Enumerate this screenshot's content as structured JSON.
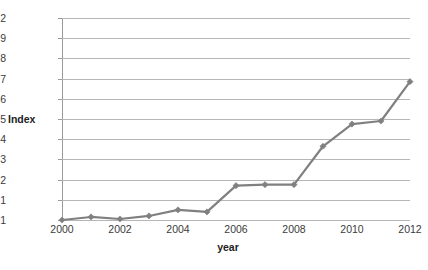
{
  "chart_data": {
    "type": "line",
    "title": "",
    "xlabel": "year",
    "ylabel": "Index",
    "x": [
      2000,
      2001,
      2002,
      2003,
      2004,
      2005,
      2006,
      2007,
      2008,
      2009,
      2010,
      2011,
      2012
    ],
    "xtick_labels": [
      "2000",
      "2001",
      "2002",
      "2003",
      "2004",
      "2005",
      "2006",
      "2007",
      "2008",
      "2009",
      "2010",
      "2011",
      "2012"
    ],
    "xtick_shown": [
      "2000",
      "",
      "2002",
      "",
      "2004",
      "",
      "2006",
      "",
      "2008",
      "",
      "2010",
      "",
      "2012"
    ],
    "values": [
      1.0,
      1.015,
      1.005,
      1.02,
      1.05,
      1.04,
      1.17,
      1.175,
      1.175,
      1.365,
      1.475,
      1.49,
      1.685
    ],
    "ytick_labels": [
      "1",
      "1.1",
      "1.2",
      "1.3",
      "1.4",
      "1.5",
      "1.6",
      "1.7",
      "1.8",
      "1.9",
      "2"
    ],
    "ytick_values": [
      1,
      1.1,
      1.2,
      1.3,
      1.4,
      1.5,
      1.6,
      1.7,
      1.8,
      1.9,
      2
    ],
    "ylim": [
      1,
      2
    ],
    "xlim": [
      2000,
      2012
    ],
    "grid": true,
    "legend": false,
    "series_color": "#808080",
    "gridline_color": "#b6b6b6",
    "axis_color": "#9a9a9a",
    "background": "#ffffff",
    "marker": "diamond"
  }
}
